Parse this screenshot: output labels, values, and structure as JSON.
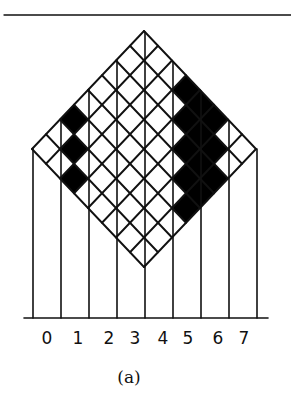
{
  "figure": {
    "caption": "(a)",
    "grid_size": 8,
    "top_rule": {
      "x1": 4,
      "x2": 291,
      "y": 15
    },
    "diamond": {
      "top_x": 144,
      "top_y": 31,
      "cell_half_w": 14,
      "cell_half_h": 14.75
    },
    "shaded_cells": [
      [
        0,
        5
      ],
      [
        1,
        6
      ],
      [
        2,
        7
      ],
      [
        3,
        0
      ],
      [
        4,
        0
      ],
      [
        5,
        0
      ],
      [
        4,
        1
      ],
      [
        5,
        1
      ],
      [
        6,
        1
      ],
      [
        5,
        2
      ],
      [
        6,
        2
      ],
      [
        7,
        2
      ],
      [
        6,
        3
      ],
      [
        7,
        3
      ],
      [
        7,
        4
      ]
    ],
    "column_lines_x": [
      33,
      61,
      89,
      117,
      145,
      173,
      201,
      229,
      257
    ],
    "baseline": {
      "x1": 24,
      "x2": 268,
      "y": 318
    },
    "axis_labels": [
      {
        "text": "0",
        "x": 47
      },
      {
        "text": "1",
        "x": 78
      },
      {
        "text": "2",
        "x": 109
      },
      {
        "text": "3",
        "x": 135
      },
      {
        "text": "4",
        "x": 163
      },
      {
        "text": "5",
        "x": 188
      },
      {
        "text": "6",
        "x": 218
      },
      {
        "text": "7",
        "x": 244
      }
    ],
    "colors": {
      "ink": "#111111",
      "fill": "#000000",
      "paper": "#ffffff"
    }
  }
}
